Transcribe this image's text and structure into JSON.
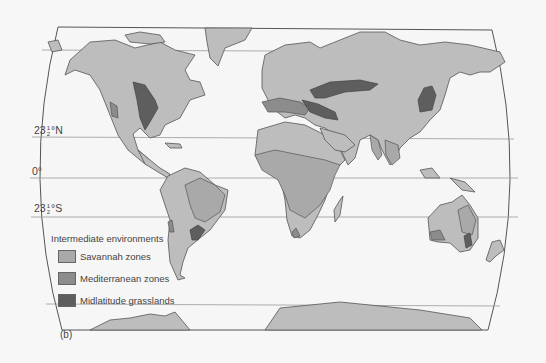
{
  "figure": {
    "panel_label": "(b)",
    "latitudes": [
      {
        "id": "tropic_cancer",
        "whole": "23",
        "num": "1",
        "den": "2",
        "suffix": "°N"
      },
      {
        "id": "equator",
        "text": "0°"
      },
      {
        "id": "tropic_capricorn",
        "whole": "23",
        "num": "1",
        "den": "2",
        "suffix": "°S"
      }
    ]
  },
  "legend": {
    "title": "Intermediate environments",
    "items": [
      {
        "label": "Savannah zones",
        "color": "#a9a9a9"
      },
      {
        "label": "Mediterranean zones",
        "color": "#8c8c8c"
      },
      {
        "label": "Midlatitude grasslands",
        "color": "#5e5e5e"
      }
    ]
  },
  "colors": {
    "background": "#f7f7f7",
    "ocean": "#f4f4f4",
    "land": "#bdbdbd",
    "outline": "#555555"
  }
}
